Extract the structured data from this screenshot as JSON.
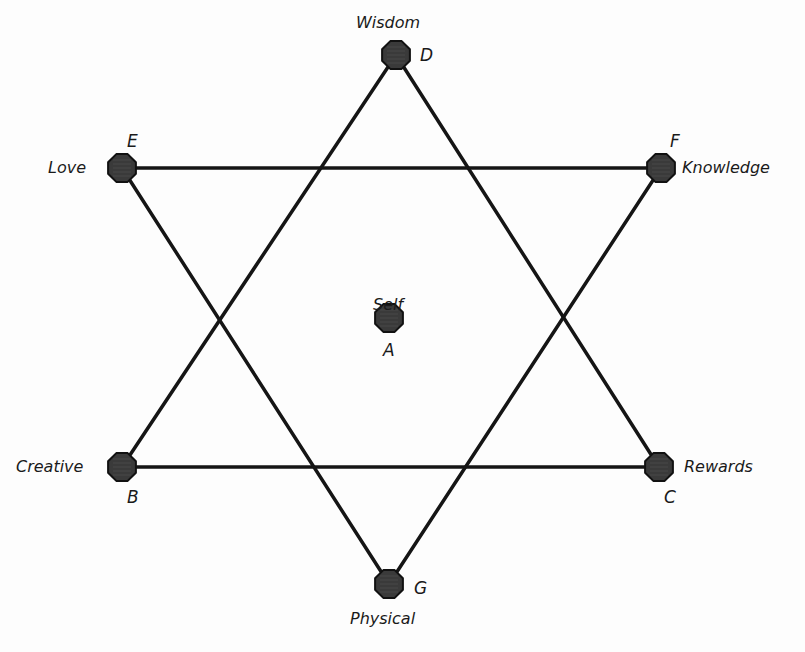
{
  "diagram": {
    "type": "hexagram",
    "colors": {
      "background": "#fdfdfd",
      "line": "#151515",
      "node_fill": "#3a3a3a",
      "node_stroke": "#111111",
      "text": "#1a1a1a"
    },
    "nodes": [
      {
        "id": "A",
        "letter": "A",
        "label": "Self",
        "x": 389,
        "y": 318
      },
      {
        "id": "B",
        "letter": "B",
        "label": "Creative",
        "x": 122,
        "y": 467
      },
      {
        "id": "C",
        "letter": "C",
        "label": "Rewards",
        "x": 659,
        "y": 467
      },
      {
        "id": "D",
        "letter": "D",
        "label": "Wisdom",
        "x": 396,
        "y": 55
      },
      {
        "id": "E",
        "letter": "E",
        "label": "Love",
        "x": 122,
        "y": 168
      },
      {
        "id": "F",
        "letter": "F",
        "label": "Knowledge",
        "x": 661,
        "y": 168
      },
      {
        "id": "G",
        "letter": "G",
        "label": "Physical",
        "x": 389,
        "y": 584
      }
    ],
    "edges": [
      {
        "from": "D",
        "to": "B"
      },
      {
        "from": "D",
        "to": "C"
      },
      {
        "from": "B",
        "to": "C"
      },
      {
        "from": "E",
        "to": "F"
      },
      {
        "from": "E",
        "to": "G"
      },
      {
        "from": "F",
        "to": "G"
      }
    ],
    "triangles": [
      {
        "name": "upward",
        "vertices": [
          "D",
          "B",
          "C"
        ]
      },
      {
        "name": "downward",
        "vertices": [
          "E",
          "F",
          "G"
        ]
      }
    ]
  }
}
